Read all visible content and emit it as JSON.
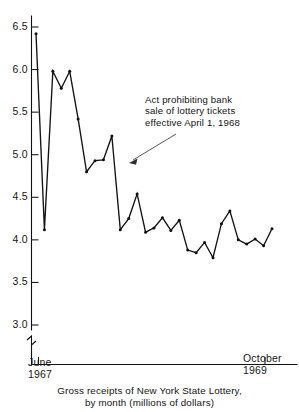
{
  "caption": {
    "line1": "Gross receipts of New York State Lottery,",
    "line2": "by month (millions of dollars)"
  },
  "annotation": {
    "line1": "Act prohibiting bank",
    "line2": "sale of lottery tickets",
    "line3": "effective April 1, 1968"
  },
  "xaxis": {
    "left_month": "June",
    "left_year": "1967",
    "right_month": "October",
    "right_year": "1969"
  },
  "yaxis": {
    "ticks": [
      "6.5",
      "6.0",
      "5.5",
      "5.0",
      "4.5",
      "4.0",
      "3.5",
      "3.0"
    ]
  },
  "colors": {
    "line": "#131313",
    "axis": "#111111",
    "text": "#141414",
    "background": "#ffffff"
  },
  "chart_data": {
    "type": "line",
    "title": "Gross receipts of New York State Lottery, by month (millions of dollars)",
    "xlabel": "",
    "ylabel": "",
    "ylim": [
      3.0,
      6.5
    ],
    "yticks": [
      3.0,
      3.5,
      4.0,
      4.5,
      5.0,
      5.5,
      6.0,
      6.5
    ],
    "axis_break": true,
    "axis_break_note": "y-axis broken below 3.0",
    "grid": false,
    "legend": null,
    "x": [
      "June 1967",
      "July 1967",
      "Aug 1967",
      "Sept 1967",
      "Oct 1967",
      "Nov 1967",
      "Dec 1967",
      "Jan 1968",
      "Feb 1968",
      "Mar 1968",
      "Apr 1968",
      "May 1968",
      "June 1968",
      "July 1968",
      "Aug 1968",
      "Sept 1968",
      "Oct 1968",
      "Nov 1968",
      "Dec 1968",
      "Jan 1969",
      "Feb 1969",
      "Mar 1969",
      "Apr 1969",
      "May 1969",
      "June 1969",
      "July 1969",
      "Aug 1969",
      "Sept 1969",
      "Oct 1969"
    ],
    "values": [
      6.42,
      4.12,
      5.98,
      5.78,
      5.98,
      5.42,
      4.8,
      4.93,
      4.94,
      5.22,
      4.12,
      4.25,
      4.54,
      4.09,
      4.14,
      4.26,
      4.11,
      4.23,
      3.88,
      3.85,
      3.97,
      3.79,
      4.19,
      4.34,
      4.0,
      3.95,
      4.01,
      3.93,
      4.13
    ],
    "annotations": [
      {
        "text": "Act prohibiting bank sale of lottery tickets effective April 1, 1968",
        "points_to_x": "Apr 1968"
      }
    ]
  }
}
